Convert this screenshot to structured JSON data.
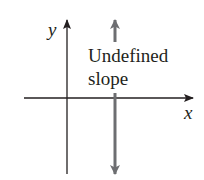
{
  "diagram": {
    "axes": {
      "x_label": "x",
      "y_label": "y",
      "axis_color": "#231f20"
    },
    "line": {
      "label_line1": "Undefined",
      "label_line2": "slope",
      "color": "#6d6e71",
      "orientation": "vertical"
    }
  }
}
